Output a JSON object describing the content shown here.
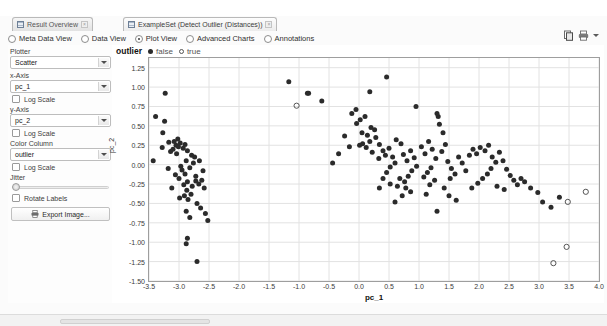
{
  "window": {
    "tabs": [
      {
        "label": "Result Overview",
        "icon": "result-overview-icon",
        "active": false,
        "closable": true
      },
      {
        "label": "ExampleSet (Detect Outlier (Distances))",
        "icon": "table-icon",
        "active": true,
        "closable": true
      }
    ]
  },
  "view_modes": {
    "options": [
      {
        "label": "Meta Data View",
        "selected": false
      },
      {
        "label": "Data View",
        "selected": false
      },
      {
        "label": "Plot View",
        "selected": true
      },
      {
        "label": "Advanced Charts",
        "selected": false
      },
      {
        "label": "Annotations",
        "selected": false
      }
    ]
  },
  "toolbar": {
    "icons": [
      "copy-icon",
      "print-icon",
      "dropdown-caret-icon"
    ]
  },
  "panel": {
    "plotter_label": "Plotter",
    "plotter_value": "Scatter",
    "x_axis_label": "x-Axis",
    "x_axis_value": "pc_1",
    "x_log_scale_label": "Log Scale",
    "x_log_scale_checked": false,
    "y_axis_label": "y-Axis",
    "y_axis_value": "pc_2",
    "y_log_scale_label": "Log Scale",
    "y_log_scale_checked": false,
    "color_column_label": "Color Column",
    "color_column_value": "outlier",
    "color_log_scale_label": "Log Scale",
    "color_log_scale_checked": false,
    "jitter_label": "Jitter",
    "jitter_value": 0,
    "rotate_labels_label": "Rotate Labels",
    "rotate_labels_checked": false,
    "export_button_label": "Export Image..."
  },
  "chart_data": {
    "type": "scatter",
    "title": "",
    "xlabel": "pc_1",
    "ylabel": "pc_2",
    "xlim": [
      -3.5,
      4.0
    ],
    "ylim": [
      -1.5,
      1.375
    ],
    "xticks": [
      -3.5,
      -3.0,
      -2.5,
      -2.0,
      -1.5,
      -1.0,
      -0.5,
      0.0,
      0.5,
      1.0,
      1.5,
      2.0,
      2.5,
      3.0,
      3.5,
      4.0
    ],
    "yticks": [
      1.25,
      1.0,
      0.75,
      0.5,
      0.25,
      0.0,
      -0.25,
      -0.5,
      -0.75,
      -1.0,
      -1.25,
      -1.5
    ],
    "ytick_labels": [
      "1.25",
      "1.00",
      "0.75",
      "0.50",
      "0.25",
      "0.00",
      "-0.25",
      "-0.50",
      "-0.75",
      "-1.00",
      "-1.25",
      "-1.50"
    ],
    "xtick_labels": [
      "-3.5",
      "-3.0",
      "-2.5",
      "-2.0",
      "-1.5",
      "-1.0",
      "-0.5",
      "0.0",
      "0.5",
      "1.0",
      "1.5",
      "2.0",
      "2.5",
      "3.0",
      "3.5",
      "4.0"
    ],
    "grid": true,
    "legend": {
      "title": "outlier",
      "position": "top",
      "entries": [
        {
          "name": "false",
          "marker": "filled-circle",
          "color": "#2b2b2b"
        },
        {
          "name": "true",
          "marker": "open-circle",
          "color": "#555555"
        }
      ]
    },
    "series": [
      {
        "name": "false",
        "marker": "filled-circle",
        "color": "#2b2b2b",
        "points": [
          [
            -3.39,
            0.62
          ],
          [
            -3.24,
            0.56
          ],
          [
            -3.23,
            0.92
          ],
          [
            -3.27,
            0.41
          ],
          [
            -3.43,
            0.05
          ],
          [
            -3.28,
            0.22
          ],
          [
            -3.17,
            0.29
          ],
          [
            -3.14,
            0.17
          ],
          [
            -3.08,
            0.3
          ],
          [
            -3.05,
            0.25
          ],
          [
            -3.02,
            0.33
          ],
          [
            -3.01,
            0.23
          ],
          [
            -2.98,
            0.28
          ],
          [
            -3.1,
            0.2
          ],
          [
            -3.18,
            -0.05
          ],
          [
            -3.04,
            0.14
          ],
          [
            -2.93,
            0.21
          ],
          [
            -2.9,
            0.26
          ],
          [
            -2.86,
            0.18
          ],
          [
            -2.97,
            -0.02
          ],
          [
            -3.06,
            -0.13
          ],
          [
            -3.0,
            -0.18
          ],
          [
            -2.95,
            -0.07
          ],
          [
            -2.9,
            -0.12
          ],
          [
            -2.88,
            0.05
          ],
          [
            -2.79,
            0.12
          ],
          [
            -2.76,
            0.02
          ],
          [
            -2.82,
            -0.04
          ],
          [
            -2.86,
            -0.22
          ],
          [
            -2.92,
            -0.26
          ],
          [
            -2.87,
            -0.33
          ],
          [
            -2.91,
            -0.4
          ],
          [
            -2.85,
            -0.45
          ],
          [
            -2.8,
            -0.38
          ],
          [
            -2.78,
            -0.28
          ],
          [
            -2.72,
            -0.21
          ],
          [
            -2.67,
            -0.25
          ],
          [
            -2.62,
            -0.2
          ],
          [
            -2.58,
            -0.3
          ],
          [
            -2.7,
            -0.5
          ],
          [
            -2.64,
            -0.56
          ],
          [
            -2.88,
            -0.6
          ],
          [
            -2.82,
            -0.68
          ],
          [
            -2.56,
            -0.63
          ],
          [
            -2.52,
            -0.72
          ],
          [
            -2.86,
            -0.95
          ],
          [
            -2.88,
            -1.02
          ],
          [
            -2.7,
            -1.25
          ],
          [
            -2.74,
            0.1
          ],
          [
            -2.66,
            0.05
          ],
          [
            -2.6,
            -0.08
          ],
          [
            -2.72,
            -0.15
          ],
          [
            -3.12,
            -0.3
          ],
          [
            -2.99,
            -0.43
          ],
          [
            -1.17,
            1.07
          ],
          [
            -0.62,
            0.82
          ],
          [
            -0.86,
            0.92
          ],
          [
            -0.84,
            0.92
          ],
          [
            -0.12,
            0.66
          ],
          [
            -0.05,
            0.71
          ],
          [
            0.02,
            0.58
          ],
          [
            -0.04,
            0.53
          ],
          [
            0.1,
            0.62
          ],
          [
            0.2,
            0.48
          ],
          [
            0.05,
            0.41
          ],
          [
            0.14,
            0.38
          ],
          [
            0.26,
            0.45
          ],
          [
            -0.24,
            0.37
          ],
          [
            -0.16,
            0.23
          ],
          [
            0.01,
            0.25
          ],
          [
            0.06,
            0.27
          ],
          [
            0.12,
            0.22
          ],
          [
            0.18,
            0.3
          ],
          [
            0.22,
            0.16
          ],
          [
            0.28,
            0.35
          ],
          [
            0.34,
            0.26
          ],
          [
            0.4,
            0.18
          ],
          [
            0.33,
            0.08
          ],
          [
            0.44,
            0.12
          ],
          [
            0.5,
            0.21
          ],
          [
            0.56,
            0.1
          ],
          [
            0.6,
            0.02
          ],
          [
            0.52,
            -0.03
          ],
          [
            0.46,
            -0.1
          ],
          [
            0.62,
            0.32
          ],
          [
            0.7,
            0.27
          ],
          [
            0.74,
            0.13
          ],
          [
            0.8,
            0.05
          ],
          [
            0.86,
            0.18
          ],
          [
            0.92,
            0.09
          ],
          [
            0.96,
            -0.02
          ],
          [
            0.88,
            -0.08
          ],
          [
            0.82,
            -0.15
          ],
          [
            0.76,
            -0.22
          ],
          [
            0.68,
            -0.18
          ],
          [
            0.64,
            -0.28
          ],
          [
            1.04,
            0.23
          ],
          [
            1.1,
            0.14
          ],
          [
            1.16,
            0.3
          ],
          [
            1.22,
            0.2
          ],
          [
            1.28,
            0.08
          ],
          [
            1.2,
            -0.04
          ],
          [
            1.14,
            -0.1
          ],
          [
            1.08,
            -0.16
          ],
          [
            1.32,
            0.62
          ],
          [
            1.3,
            0.66
          ],
          [
            1.34,
            0.52
          ],
          [
            1.4,
            0.41
          ],
          [
            1.44,
            0.26
          ],
          [
            1.38,
            0.17
          ],
          [
            1.26,
            -0.2
          ],
          [
            1.18,
            -0.26
          ],
          [
            1.48,
            0.04
          ],
          [
            1.54,
            -0.05
          ],
          [
            1.6,
            -0.12
          ],
          [
            1.52,
            -0.18
          ],
          [
            1.66,
            0.1
          ],
          [
            1.72,
            0.02
          ],
          [
            1.78,
            -0.08
          ],
          [
            1.84,
            0.12
          ],
          [
            1.9,
            0.2
          ],
          [
            1.96,
            0.14
          ],
          [
            2.02,
            0.22
          ],
          [
            2.1,
            0.18
          ],
          [
            2.16,
            0.25
          ],
          [
            2.22,
            0.1
          ],
          [
            2.28,
            0.03
          ],
          [
            2.2,
            -0.05
          ],
          [
            2.14,
            -0.12
          ],
          [
            2.06,
            -0.18
          ],
          [
            1.98,
            -0.24
          ],
          [
            1.88,
            -0.3
          ],
          [
            2.34,
            0.16
          ],
          [
            2.4,
            0.05
          ],
          [
            2.46,
            -0.06
          ],
          [
            2.52,
            -0.14
          ],
          [
            2.58,
            -0.2
          ],
          [
            2.64,
            -0.26
          ],
          [
            2.7,
            -0.18
          ],
          [
            2.76,
            -0.22
          ],
          [
            2.86,
            -0.3
          ],
          [
            2.98,
            -0.36
          ],
          [
            3.06,
            -0.48
          ],
          [
            3.2,
            -0.55
          ],
          [
            3.34,
            -0.42
          ],
          [
            0.95,
            0.75
          ],
          [
            0.46,
            1.13
          ],
          [
            0.18,
            0.94
          ],
          [
            0.72,
            -0.4
          ],
          [
            0.86,
            -0.35
          ],
          [
            1.12,
            -0.38
          ],
          [
            1.3,
            -0.6
          ],
          [
            1.62,
            -0.46
          ],
          [
            0.34,
            -0.3
          ],
          [
            0.6,
            -0.48
          ],
          [
            -0.34,
            0.14
          ],
          [
            -0.44,
            0.02
          ],
          [
            1.42,
            -0.3
          ],
          [
            1.5,
            -0.4
          ],
          [
            2.42,
            -0.32
          ],
          [
            2.3,
            -0.28
          ],
          [
            0.4,
            -0.18
          ],
          [
            0.52,
            -0.25
          ],
          [
            0.78,
            -0.3
          ]
        ]
      },
      {
        "name": "true",
        "marker": "open-circle",
        "color": "#555555",
        "points": [
          [
            -1.04,
            0.76
          ],
          [
            3.78,
            -0.35
          ],
          [
            3.48,
            -0.48
          ],
          [
            3.46,
            -1.06
          ],
          [
            3.24,
            -1.27
          ]
        ]
      }
    ]
  }
}
